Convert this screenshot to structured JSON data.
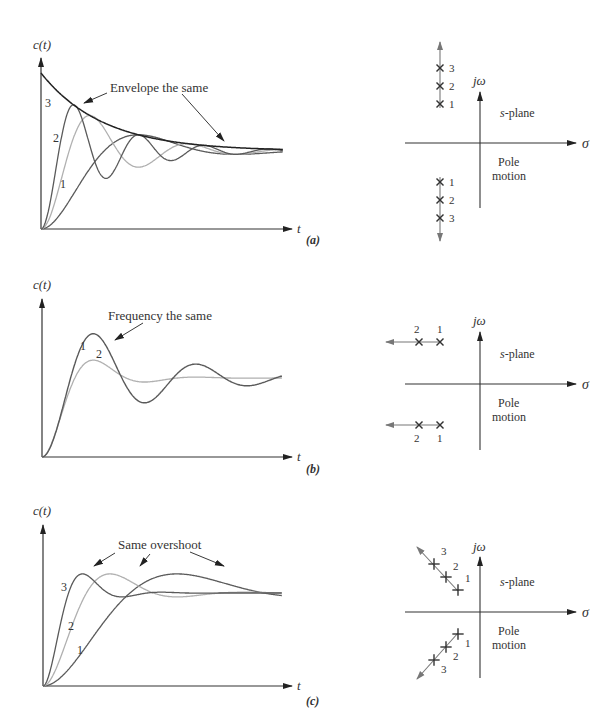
{
  "figure": {
    "panels": [
      {
        "id": "a",
        "caption": "(a)",
        "ylabel": "c(t)",
        "xlabel": "t",
        "annotation": "Envelope the same",
        "curve_labels": [
          "1",
          "2",
          "3"
        ],
        "splane": {
          "jw_label": "jω",
          "sigma_label": "σ",
          "plane_label_s": "s",
          "plane_label_rest": "-plane",
          "motion_label_1": "Pole",
          "motion_label_2": "motion",
          "pole_labels_upper": [
            "3",
            "2",
            "1"
          ],
          "pole_labels_lower": [
            "1",
            "2",
            "3"
          ]
        }
      },
      {
        "id": "b",
        "caption": "(b)",
        "ylabel": "c(t)",
        "xlabel": "t",
        "annotation": "Frequency the same",
        "curve_labels": [
          "1",
          "2"
        ],
        "splane": {
          "jw_label": "jω",
          "sigma_label": "σ",
          "plane_label_s": "s",
          "plane_label_rest": "-plane",
          "motion_label_1": "Pole",
          "motion_label_2": "motion",
          "pole_labels_upper": [
            "2",
            "1"
          ],
          "pole_labels_lower": [
            "2",
            "1"
          ]
        }
      },
      {
        "id": "c",
        "caption": "(c)",
        "ylabel": "c(t)",
        "xlabel": "t",
        "annotation": "Same overshoot",
        "curve_labels": [
          "1",
          "2",
          "3"
        ],
        "splane": {
          "jw_label": "jω",
          "sigma_label": "σ",
          "plane_label_s": "s",
          "plane_label_rest": "-plane",
          "motion_label_1": "Pole",
          "motion_label_2": "motion",
          "pole_labels_upper": [
            "3",
            "2",
            "1"
          ],
          "pole_labels_lower": [
            "1",
            "2",
            "3"
          ]
        }
      }
    ],
    "colors": {
      "axis": "#333333",
      "dark_curve": "#5a5a5a",
      "light_curve": "#b0b0b0",
      "envelope": "#222222",
      "pole_arrow": "#777777"
    }
  },
  "chart_data": [
    {
      "type": "line",
      "title": "(a) Constant real part: poles move vertically, envelope the same",
      "xlabel": "t",
      "ylabel": "c(t)",
      "grid": false,
      "annotations": [
        "Envelope the same"
      ],
      "series": [
        {
          "name": "1",
          "sigma": 1.0,
          "omega_d": 2.0
        },
        {
          "name": "2",
          "sigma": 1.0,
          "omega_d": 4.0
        },
        {
          "name": "3",
          "sigma": 1.0,
          "omega_d": 6.0
        },
        {
          "name": "envelope",
          "form": "1 + exp(-sigma t)"
        }
      ],
      "poles": {
        "motion": "vertical (increasing imaginary part)",
        "order": [
          "1",
          "2",
          "3"
        ]
      }
    },
    {
      "type": "line",
      "title": "(b) Constant imaginary part: poles move horizontally, frequency the same",
      "xlabel": "t",
      "ylabel": "c(t)",
      "grid": false,
      "annotations": [
        "Frequency the same"
      ],
      "series": [
        {
          "name": "1",
          "sigma": 0.35,
          "omega_d": 1.9
        },
        {
          "name": "2",
          "sigma": 0.9,
          "omega_d": 1.9
        }
      ],
      "poles": {
        "motion": "horizontal (more negative real part)",
        "order": [
          "1",
          "2"
        ]
      }
    },
    {
      "type": "line",
      "title": "(c) Constant damping ratio: poles move radially, same overshoot",
      "xlabel": "t",
      "ylabel": "c(t)",
      "grid": false,
      "annotations": [
        "Same overshoot"
      ],
      "series": [
        {
          "name": "1",
          "zeta": 0.45,
          "omega_n": 1.0
        },
        {
          "name": "2",
          "zeta": 0.45,
          "omega_n": 2.0
        },
        {
          "name": "3",
          "zeta": 0.45,
          "omega_n": 3.4
        }
      ],
      "poles": {
        "motion": "radial along constant-zeta line",
        "order": [
          "1",
          "2",
          "3"
        ]
      }
    }
  ]
}
